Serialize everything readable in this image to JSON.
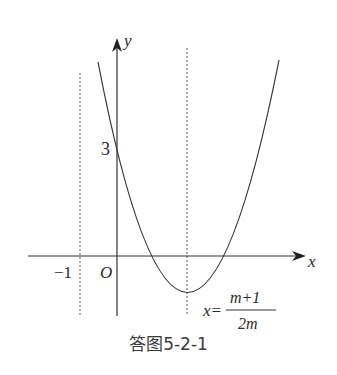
{
  "figure": {
    "caption": "答图5-2-1",
    "axes": {
      "x_label": "x",
      "y_label": "y",
      "origin_label": "O"
    },
    "labels": {
      "y_intercept": "3",
      "neg_one": "−1",
      "axis_eq_prefix": "x=",
      "axis_eq_numerator": "m+1",
      "axis_eq_denominator": "2m"
    },
    "elements": [
      "parabola opening upward with y-intercept 3",
      "dashed vertical line x = -1",
      "dashed vertical line through vertex x = (m+1)/(2m)"
    ]
  }
}
